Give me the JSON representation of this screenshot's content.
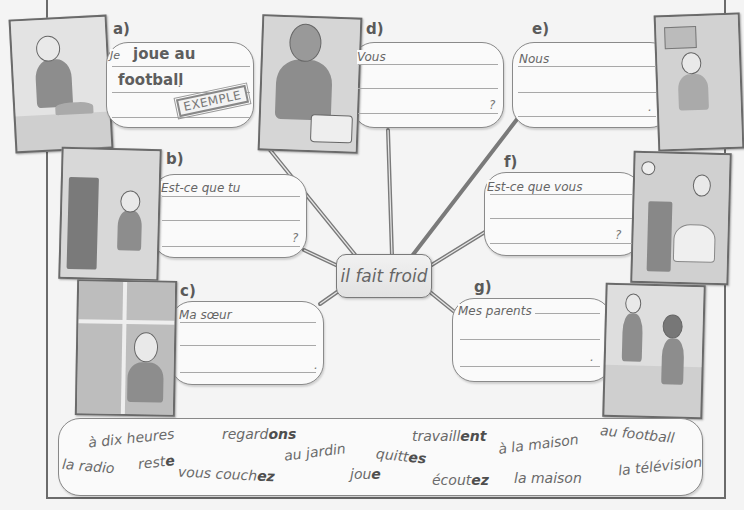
{
  "center_topic": "il fait froid",
  "example_stamp": "EXEMPLE",
  "items": [
    {
      "label": "a)",
      "prompt": "Je",
      "answer_line1": "joue au",
      "answer_line2": "football",
      "end": ".",
      "is_example": true
    },
    {
      "label": "b)",
      "prompt": "Est-ce que tu",
      "end": "?"
    },
    {
      "label": "c)",
      "prompt": "Ma sœur",
      "end": "."
    },
    {
      "label": "d)",
      "prompt": "Vous",
      "end": "?"
    },
    {
      "label": "e)",
      "prompt": "Nous",
      "end": "."
    },
    {
      "label": "f)",
      "prompt": "Est-ce que vous",
      "end": "?"
    },
    {
      "label": "g)",
      "prompt": "Mes parents",
      "end": "."
    }
  ],
  "word_bank": [
    {
      "stem": "à dix heures",
      "ending": ""
    },
    {
      "stem": "regard",
      "ending": "ons"
    },
    {
      "stem": "travaill",
      "ending": "ent"
    },
    {
      "stem": "au football",
      "ending": ""
    },
    {
      "stem": "la radio",
      "ending": ""
    },
    {
      "stem": "rest",
      "ending": "e"
    },
    {
      "stem": "au jardin",
      "ending": ""
    },
    {
      "stem": "quitt",
      "ending": "es"
    },
    {
      "stem": "à la maison",
      "ending": ""
    },
    {
      "stem": "vous couch",
      "ending": "ez"
    },
    {
      "stem": "jou",
      "ending": "e"
    },
    {
      "stem": "écout",
      "ending": "ez"
    },
    {
      "stem": "la maison",
      "ending": ""
    },
    {
      "stem": "la télévision",
      "ending": ""
    }
  ]
}
